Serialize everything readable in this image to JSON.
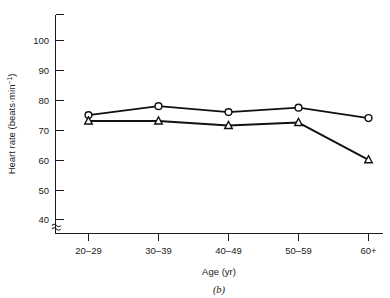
{
  "chart_data": {
    "type": "line",
    "title": "",
    "caption": "(b)",
    "xlabel": "Age (yr)",
    "ylabel": "Heart rate (beats·min",
    "ylabel_sup": "−1",
    "ylabel_tail": ")",
    "categories": [
      "20–29",
      "30–39",
      "40–49",
      "50–59",
      "60+"
    ],
    "yticks": [
      40,
      50,
      60,
      70,
      80,
      90,
      100
    ],
    "ytick_labels": [
      "40",
      "50",
      "60",
      "70",
      "80",
      "90",
      "100"
    ],
    "ylim": [
      35,
      108
    ],
    "y_axis_broken": true,
    "grid": false,
    "legend": "none",
    "series": [
      {
        "name": "circles",
        "marker": "open-circle",
        "values": [
          75,
          78,
          76,
          77.5,
          74
        ]
      },
      {
        "name": "triangles",
        "marker": "open-triangle",
        "values": [
          73,
          73,
          71.5,
          72.5,
          60
        ]
      }
    ]
  },
  "figure": {
    "panel_label": "(b)"
  }
}
